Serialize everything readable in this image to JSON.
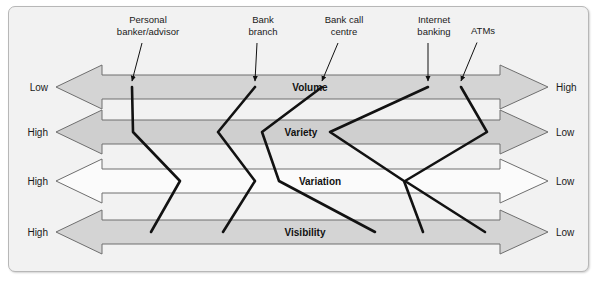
{
  "figure": {
    "title": "",
    "background_color": "#f2f2f2",
    "border_color": "#b7b7b7"
  },
  "chart_data": {
    "type": "diagram",
    "diagram_kind": "four-vs-profile",
    "title": "",
    "xlabel": "",
    "ylabel": "",
    "grid": false,
    "legend": "none",
    "dimensions": [
      {
        "name": "Volume",
        "left_label": "Low",
        "right_label": "High",
        "fill": "#d4d4d4",
        "row_center_y": 87
      },
      {
        "name": "Variety",
        "left_label": "High",
        "right_label": "Low",
        "fill": "#cfcfcf",
        "row_center_y": 132
      },
      {
        "name": "Variation",
        "left_label": "High",
        "right_label": "Low",
        "fill": "#fbfbfb",
        "row_center_y": 181
      },
      {
        "name": "Visibility",
        "left_label": "High",
        "right_label": "Low",
        "fill": "#d4d4d4",
        "row_center_y": 232
      }
    ],
    "services": [
      {
        "label": "Personal banker/advisor",
        "label_lines": [
          "Personal",
          "banker/advisor"
        ],
        "label_x": 148,
        "label_top_y": 14,
        "pointer_tip_x": 132,
        "pointer_tip_y": 81,
        "positions": {
          "Volume": 132,
          "Variety": 133,
          "Variation": 180,
          "Visibility": 151
        }
      },
      {
        "label": "Bank branch",
        "label_lines": [
          "Bank",
          "branch"
        ],
        "label_x": 263,
        "label_top_y": 14,
        "pointer_tip_x": 255,
        "pointer_tip_y": 81,
        "positions": {
          "Volume": 255,
          "Variety": 218,
          "Variation": 255,
          "Visibility": 223
        }
      },
      {
        "label": "Bank call centre",
        "label_lines": [
          "Bank call",
          "centre"
        ],
        "label_x": 344,
        "label_top_y": 14,
        "pointer_tip_x": 322,
        "pointer_tip_y": 81,
        "positions": {
          "Volume": 322,
          "Variety": 262,
          "Variation": 279,
          "Visibility": 375
        }
      },
      {
        "label": "Internet banking",
        "label_lines": [
          "Internet",
          "banking"
        ],
        "label_x": 434,
        "label_top_y": 14,
        "pointer_tip_x": 428,
        "pointer_tip_y": 81,
        "positions": {
          "Volume": 428,
          "Variety": 330,
          "Variation": 404,
          "Visibility": 423
        }
      },
      {
        "label": "ATMs",
        "label_lines": [
          "ATMs"
        ],
        "label_x": 483,
        "label_top_y": 25,
        "pointer_tip_x": 461,
        "pointer_tip_y": 81,
        "positions": {
          "Volume": 461,
          "Variety": 487,
          "Variation": 405,
          "Visibility": 485
        }
      }
    ]
  },
  "labels": {
    "columns": [
      {
        "line1": "Personal",
        "line2": "banker/advisor"
      },
      {
        "line1": "Bank",
        "line2": "branch"
      },
      {
        "line1": "Bank call",
        "line2": "centre"
      },
      {
        "line1": "Internet",
        "line2": "banking"
      },
      {
        "line1": "ATMs",
        "line2": ""
      }
    ],
    "rows": [
      {
        "name": "Volume",
        "left": "Low",
        "right": "High"
      },
      {
        "name": "Variety",
        "left": "High",
        "right": "Low"
      },
      {
        "name": "Variation",
        "left": "High",
        "right": "Low"
      },
      {
        "name": "Visibility",
        "left": "High",
        "right": "Low"
      }
    ]
  }
}
